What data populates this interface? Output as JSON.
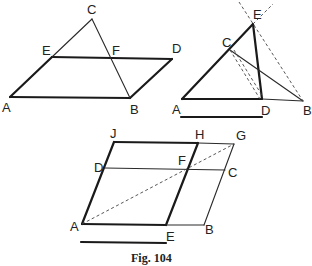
{
  "caption": "Fig. 104",
  "figures": [
    {
      "id": "fig-parallelogram-triangle",
      "labels": {
        "A": "A",
        "B": "B",
        "C": "C",
        "D": "D",
        "E": "E",
        "F": "F"
      }
    },
    {
      "id": "fig-triangle-construction",
      "labels": {
        "A": "A",
        "B": "B",
        "C": "C",
        "D": "D",
        "E": "E"
      }
    },
    {
      "id": "fig-parallelogram-gnomon",
      "labels": {
        "A": "A",
        "B": "B",
        "C": "C",
        "D": "D",
        "E": "E",
        "F": "F",
        "G": "G",
        "H": "H",
        "J": "J"
      }
    }
  ]
}
